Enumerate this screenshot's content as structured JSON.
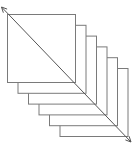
{
  "diagram": {
    "type": "stacked-layers",
    "layer_count": 6,
    "layers": [
      {
        "x": 7,
        "y": 14,
        "size": 68
      },
      {
        "x": 17.5,
        "y": 24.8,
        "size": 68
      },
      {
        "x": 28,
        "y": 35.6,
        "size": 68
      },
      {
        "x": 38.5,
        "y": 46.4,
        "size": 68
      },
      {
        "x": 49,
        "y": 57.2,
        "size": 68
      },
      {
        "x": 59.5,
        "y": 68,
        "size": 68
      }
    ],
    "arrow": {
      "x1": 1.5,
      "y1": 7,
      "x2": 131,
      "y2": 142,
      "heads": "both"
    },
    "colors": {
      "stroke": "#7a7a7a",
      "fill": "#ffffff",
      "background": "#ffffff"
    }
  }
}
